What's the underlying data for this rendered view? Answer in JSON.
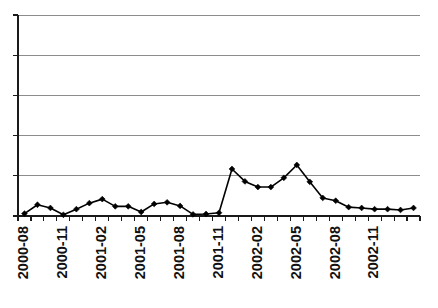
{
  "chart_data": {
    "type": "line",
    "title": "",
    "subtitle": "",
    "xlabel": "",
    "ylabel": "",
    "legend": [],
    "legend_position": "none",
    "grid": true,
    "grid_axis": "y",
    "gridline_count": 6,
    "y_axis_labels_shown": false,
    "ylim": [
      0,
      5
    ],
    "y_gridline_values": [
      0,
      1,
      2,
      3,
      4,
      5
    ],
    "x": [
      "2000-08",
      "2000-09",
      "2000-10",
      "2000-11",
      "2000-12",
      "2001-01",
      "2001-02",
      "2001-03",
      "2001-04",
      "2001-05",
      "2001-06",
      "2001-07",
      "2001-08",
      "2001-09",
      "2001-10",
      "2001-11",
      "2001-12",
      "2002-01",
      "2002-02",
      "2002-03",
      "2002-04",
      "2002-05",
      "2002-06",
      "2002-07",
      "2002-08",
      "2002-09",
      "2002-10",
      "2002-11",
      "2002-12",
      "2003-01",
      "2003-02"
    ],
    "values": [
      0.06,
      0.28,
      0.2,
      0.03,
      0.17,
      0.32,
      0.42,
      0.24,
      0.24,
      0.1,
      0.3,
      0.34,
      0.25,
      0.04,
      0.05,
      0.08,
      1.17,
      0.86,
      0.72,
      0.72,
      0.95,
      1.27,
      0.85,
      0.45,
      0.38,
      0.22,
      0.2,
      0.17,
      0.17,
      0.15,
      0.2
    ],
    "tick_label_positions": [
      0,
      3,
      6,
      9,
      12,
      15,
      18,
      21,
      24,
      27
    ],
    "tick_labels": [
      "2000-08",
      "2000-11",
      "2001-02",
      "2001-05",
      "2001-08",
      "2001-11",
      "2002-02",
      "2002-05",
      "2002-08",
      "2002-11"
    ],
    "marker": "diamond",
    "marker_color": "#000000",
    "line_color": "#000000",
    "gridline_color": "#8c8c8c",
    "axis_color": "#1a1a1a",
    "background_color": "#ffffff"
  },
  "layout": {
    "plot_left": 18,
    "plot_right": 420,
    "plot_top": 15,
    "plot_bottom": 216,
    "tick_length": 5,
    "label_rotation": -90
  }
}
